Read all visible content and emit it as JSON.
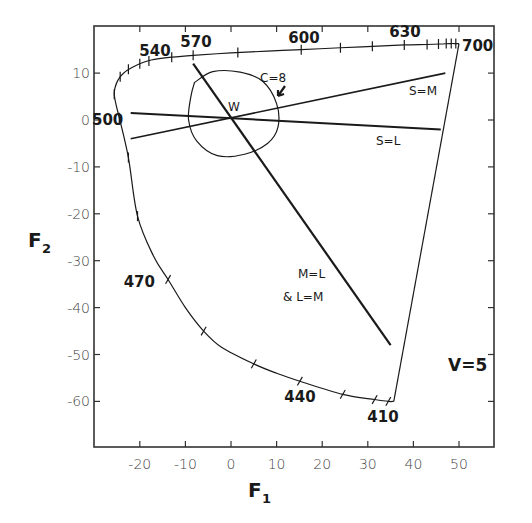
{
  "chart_data": {
    "type": "line",
    "title": "",
    "xlabel": "F1",
    "ylabel": "F2",
    "xlim": [
      -30,
      59
    ],
    "ylim": [
      -70,
      20
    ],
    "grid": false,
    "xticks": [
      -20,
      -10,
      0,
      10,
      20,
      30,
      40,
      50
    ],
    "yticks": [
      10,
      0,
      -10,
      -20,
      -30,
      -40,
      -50,
      -60
    ],
    "xtick_labels": [
      "-20",
      "-10",
      "0",
      "10",
      "20",
      "30",
      "40",
      "50"
    ],
    "ytick_labels": [
      "10",
      "0",
      "-10",
      "-20",
      "-30",
      "-40",
      "-50",
      "-60"
    ],
    "annotations": {
      "white_point": {
        "label": "W",
        "x": 0,
        "y": 0
      },
      "contour": {
        "label": "C=8"
      },
      "s_eq_m": {
        "label": "S=M"
      },
      "s_eq_l": {
        "label": "S=L"
      },
      "m_eq_l": {
        "label_line1": "M=L",
        "label_line2": "& L=M"
      },
      "v_level": {
        "label": "V=5"
      }
    },
    "wavelength_labels": [
      {
        "label": "540",
        "x": -20,
        "y": 13
      },
      {
        "label": "570",
        "x": -8.3,
        "y": 14
      },
      {
        "label": "600",
        "x": 15.4,
        "y": 15
      },
      {
        "label": "630",
        "x": 38,
        "y": 16
      },
      {
        "label": "700",
        "x": 50,
        "y": 16
      },
      {
        "label": "500",
        "x": -24.5,
        "y": 0.5
      },
      {
        "label": "470",
        "x": -13.8,
        "y": -34
      },
      {
        "label": "440",
        "x": 15.1,
        "y": -55.7
      },
      {
        "label": "410",
        "x": 34.5,
        "y": -60
      }
    ],
    "series": [
      {
        "name": "spectral-locus",
        "points": [
          [
            -24.5,
            0.5
          ],
          [
            -25.6,
            5.5
          ],
          [
            -24.8,
            8.5
          ],
          [
            -23.3,
            10.2
          ],
          [
            -21.5,
            11.3
          ],
          [
            -20,
            12.0
          ],
          [
            -17.5,
            12.8
          ],
          [
            -13,
            13.4
          ],
          [
            -8.3,
            13.8
          ],
          [
            0,
            14.3
          ],
          [
            8,
            14.7
          ],
          [
            15.4,
            15.0
          ],
          [
            24,
            15.4
          ],
          [
            31,
            15.7
          ],
          [
            38,
            16.0
          ],
          [
            43,
            16.1
          ],
          [
            46,
            16.2
          ],
          [
            48,
            16.3
          ],
          [
            49.3,
            16.3
          ],
          [
            50,
            16.3
          ]
        ]
      },
      {
        "name": "spectral-locus-blue",
        "points": [
          [
            -24.5,
            0.5
          ],
          [
            -22.5,
            -8
          ],
          [
            -20.5,
            -20.5
          ],
          [
            -17,
            -29
          ],
          [
            -13.8,
            -34
          ],
          [
            -10,
            -40
          ],
          [
            -6,
            -45
          ],
          [
            -2,
            -48.5
          ],
          [
            5,
            -52
          ],
          [
            10,
            -54
          ],
          [
            15.1,
            -55.7
          ],
          [
            24.5,
            -58.5
          ],
          [
            31.5,
            -59.6
          ],
          [
            34.5,
            -60
          ],
          [
            35.7,
            -60
          ]
        ]
      },
      {
        "name": "purple-line",
        "points": [
          [
            35.7,
            -60
          ],
          [
            50,
            16.3
          ]
        ]
      },
      {
        "name": "M=L",
        "points": [
          [
            -8.3,
            12
          ],
          [
            35,
            -48
          ]
        ]
      },
      {
        "name": "S=M",
        "points": [
          [
            -22,
            -4
          ],
          [
            47,
            10
          ]
        ]
      },
      {
        "name": "S=L",
        "points": [
          [
            -22,
            1.5
          ],
          [
            46,
            -2
          ]
        ]
      },
      {
        "name": "C=8 contour",
        "points": [
          [
            -8,
            8
          ],
          [
            -4,
            10.3
          ],
          [
            2,
            10.2
          ],
          [
            7,
            8.2
          ],
          [
            10,
            3.5
          ],
          [
            10.3,
            -1.5
          ],
          [
            8,
            -5
          ],
          [
            3,
            -7.3
          ],
          [
            -3,
            -7.6
          ],
          [
            -7.5,
            -4.5
          ],
          [
            -9.3,
            0
          ],
          [
            -8.8,
            5
          ],
          [
            -8,
            8
          ]
        ]
      }
    ]
  },
  "axes": {
    "x_title": "F",
    "x_sub": "1",
    "y_title": "F",
    "y_sub": "2"
  }
}
